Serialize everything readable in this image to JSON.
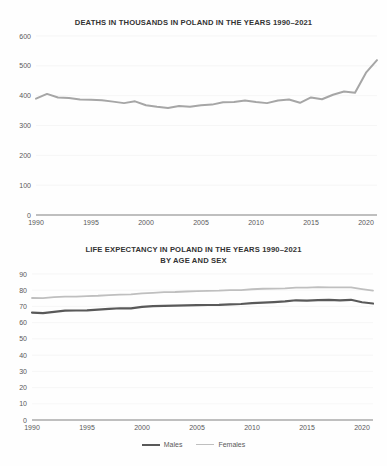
{
  "page": {
    "background": "#ffffff",
    "text_color": "#3f3f3f"
  },
  "figures": [
    {
      "id": "deaths",
      "title_line1": "DEATHS IN THOUSANDS IN POLAND IN THE YEARS 1990–2021",
      "title_line2": ""
    },
    {
      "id": "life",
      "title_line1": "LIFE EXPECTANCY IN POLAND IN THE YEARS 1990–2021",
      "title_line2": "BY AGE AND SEX"
    }
  ],
  "legend": {
    "items": [
      {
        "label": "Males",
        "color": "#595959",
        "width": 2.2
      },
      {
        "label": "Females",
        "color": "#bfbfbf",
        "width": 1.6
      }
    ]
  },
  "chart_data": [
    {
      "type": "line",
      "title": "DEATHS IN THOUSANDS IN POLAND IN THE YEARS 1990–2021",
      "xlabel": "",
      "ylabel": "",
      "grid": true,
      "legend_position": "none",
      "xlim": [
        1990,
        2021
      ],
      "ylim": [
        0,
        600
      ],
      "ytick_values": [
        0,
        100,
        200,
        300,
        400,
        500,
        600
      ],
      "ytick_labels": [
        "0",
        "100",
        "200",
        "300",
        "400",
        "500",
        "600"
      ],
      "xtick_values": [
        1990,
        1995,
        2000,
        2005,
        2010,
        2015,
        2020
      ],
      "xtick_labels": [
        "1990",
        "1995",
        "2000",
        "2005",
        "2010",
        "2015",
        "2020"
      ],
      "x": [
        1990,
        1991,
        1992,
        1993,
        1994,
        1995,
        1996,
        1997,
        1998,
        1999,
        2000,
        2001,
        2002,
        2003,
        2004,
        2005,
        2006,
        2007,
        2008,
        2009,
        2010,
        2011,
        2012,
        2013,
        2014,
        2015,
        2016,
        2017,
        2018,
        2019,
        2020,
        2021
      ],
      "series": [
        {
          "name": "Deaths",
          "color": "#a6a6a6",
          "width": 2.0,
          "values": [
            390,
            406,
            394,
            392,
            387,
            386,
            385,
            380,
            375,
            381,
            368,
            363,
            359,
            365,
            363,
            368,
            370,
            378,
            379,
            384,
            379,
            375,
            384,
            387,
            376,
            394,
            388,
            403,
            414,
            410,
            477,
            519
          ]
        }
      ]
    },
    {
      "type": "line",
      "title": "LIFE EXPECTANCY IN POLAND IN THE YEARS 1990–2021 BY AGE AND SEX",
      "xlabel": "",
      "ylabel": "",
      "grid": true,
      "legend_position": "bottom",
      "xlim": [
        1990,
        2021
      ],
      "ylim": [
        0,
        90
      ],
      "ytick_values": [
        0,
        10,
        20,
        30,
        40,
        50,
        60,
        70,
        80,
        90
      ],
      "ytick_labels": [
        "0",
        "10",
        "20",
        "30",
        "40",
        "50",
        "60",
        "70",
        "80",
        "90"
      ],
      "xtick_values": [
        1990,
        1995,
        2000,
        2005,
        2010,
        2015,
        2020
      ],
      "xtick_labels": [
        "1990",
        "1995",
        "2000",
        "2005",
        "2010",
        "2015",
        "2020"
      ],
      "x": [
        1990,
        1991,
        1992,
        1993,
        1994,
        1995,
        1996,
        1997,
        1998,
        1999,
        2000,
        2001,
        2002,
        2003,
        2004,
        2005,
        2006,
        2007,
        2008,
        2009,
        2010,
        2011,
        2012,
        2013,
        2014,
        2015,
        2016,
        2017,
        2018,
        2019,
        2020,
        2021
      ],
      "series": [
        {
          "name": "Males",
          "color": "#595959",
          "width": 2.2,
          "values": [
            66.2,
            65.9,
            66.7,
            67.4,
            67.5,
            67.6,
            68.1,
            68.5,
            68.9,
            68.8,
            69.7,
            70.2,
            70.4,
            70.5,
            70.7,
            70.8,
            70.9,
            71.0,
            71.3,
            71.5,
            72.1,
            72.4,
            72.7,
            73.1,
            73.8,
            73.6,
            73.9,
            74.0,
            73.8,
            74.1,
            72.6,
            71.8
          ]
        },
        {
          "name": "Females",
          "color": "#bfbfbf",
          "width": 1.8,
          "values": [
            75.2,
            75.1,
            75.7,
            76.0,
            76.1,
            76.4,
            76.6,
            77.0,
            77.3,
            77.5,
            78.0,
            78.4,
            78.8,
            78.9,
            79.2,
            79.4,
            79.6,
            79.7,
            80.0,
            80.1,
            80.6,
            80.9,
            81.0,
            81.1,
            81.6,
            81.6,
            81.9,
            81.8,
            81.7,
            81.8,
            80.7,
            79.7
          ]
        }
      ]
    }
  ]
}
